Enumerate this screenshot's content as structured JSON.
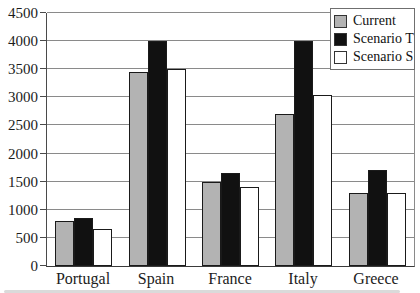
{
  "chart_data": {
    "type": "bar",
    "title": "",
    "categories": [
      "Portugal",
      "Spain",
      "France",
      "Italy",
      "Greece"
    ],
    "series": [
      {
        "name": "Current",
        "color": "#b3b3b3",
        "values": [
          800,
          3450,
          1500,
          2700,
          1300
        ]
      },
      {
        "name": "Scenario T",
        "color": "#111111",
        "values": [
          850,
          4000,
          1650,
          4000,
          1700
        ]
      },
      {
        "name": "Scenario S",
        "color": "#ffffff",
        "values": [
          650,
          3500,
          1400,
          3050,
          1300
        ]
      }
    ],
    "xlabel": "",
    "ylabel": "",
    "ylim": [
      0,
      4500
    ],
    "yticks": [
      0,
      500,
      1000,
      1500,
      2000,
      2500,
      3000,
      3500,
      4000,
      4500
    ],
    "grid": true,
    "legend_position": "top-right",
    "legend_items": [
      "Current",
      "Scenario T",
      "Scenario S"
    ]
  },
  "colors": {
    "background": "#ffffff",
    "gridline": "#8a8a8a",
    "axis": "#444444",
    "bar_border": "#1a1a1a",
    "text": "#1c1c1c"
  }
}
